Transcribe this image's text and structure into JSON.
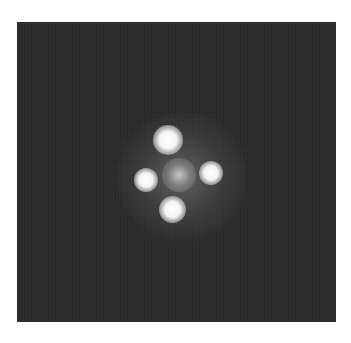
{
  "image": {
    "description": "Grayscale astronomical image of a gravitationally lensed quasar (Einstein Cross): four bright point images arranged in a cross around a faint central galaxy on a dark noisy background",
    "background_color": "#2a2a2a",
    "page_color": "#ffffff",
    "frame": {
      "x": 17,
      "y": 22,
      "width": 319,
      "height": 300
    },
    "objects": [
      {
        "name": "top-image",
        "cx": 168,
        "cy": 140,
        "size": 30
      },
      {
        "name": "left-image",
        "cx": 146,
        "cy": 180,
        "size": 24
      },
      {
        "name": "right-image",
        "cx": 211,
        "cy": 173,
        "size": 24
      },
      {
        "name": "bottom-image",
        "cx": 173,
        "cy": 210,
        "size": 27
      },
      {
        "name": "central-galaxy",
        "cx": 179,
        "cy": 175,
        "size": 34
      }
    ]
  }
}
